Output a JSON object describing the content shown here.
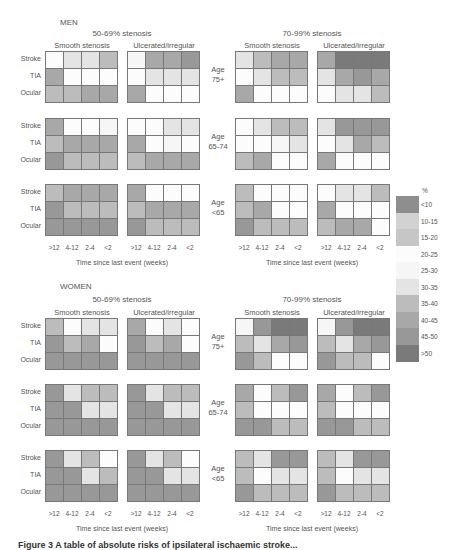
{
  "chart_data": {
    "type": "heatmap",
    "title": "",
    "sexes": [
      "MEN",
      "WOMEN"
    ],
    "stenosis_groups": [
      "50-69% stenosis",
      "70-99% stenosis"
    ],
    "plaque_types": [
      "Smooth stenosis",
      "Ulcerated/irregular"
    ],
    "age_groups": [
      "Age 75+",
      "Age 65-74",
      "Age <65"
    ],
    "rows": [
      "Stroke",
      "TIA",
      "Ocular"
    ],
    "x_ticks": [
      ">12",
      "4-12",
      "2-4",
      "<2"
    ],
    "xlabel": "Time since last event (weeks)",
    "legend": {
      "title": "%",
      "categories": [
        "<10",
        "10-15",
        "15-20",
        "20-25",
        "25-30",
        "30-35",
        "35-40",
        "40-45",
        "45-50",
        ">50"
      ],
      "colors": [
        "#8e8e8e",
        "#d2d2d2",
        "#c6c6c6",
        "#fcfcfc",
        "#f6f6f6",
        "#e4e4e4",
        "#bcbcbc",
        "#a8a8a8",
        "#989898",
        "#7a7a7a"
      ]
    },
    "note": "Cell values are legend category indices (0='<10' ... 9='>50') estimated from grey shade",
    "panels": {
      "MEN": {
        "50-69% stenosis": {
          "Smooth stenosis": {
            "Age 75+": [
              [
                3,
                5,
                5,
                6
              ],
              [
                7,
                3,
                3,
                3
              ],
              [
                6,
                6,
                7,
                7
              ]
            ],
            "Age 65-74": [
              [
                7,
                3,
                3,
                4
              ],
              [
                6,
                7,
                7,
                7
              ],
              [
                8,
                6,
                6,
                6
              ]
            ],
            "Age <65": [
              [
                6,
                7,
                7,
                7
              ],
              [
                8,
                6,
                6,
                6
              ],
              [
                8,
                8,
                8,
                8
              ]
            ]
          },
          "Ulcerated/irregular": {
            "Age 75+": [
              [
                4,
                7,
                7,
                8
              ],
              [
                3,
                5,
                5,
                5
              ],
              [
                7,
                3,
                3,
                3
              ]
            ],
            "Age 65-74": [
              [
                3,
                3,
                5,
                5
              ],
              [
                7,
                3,
                4,
                3
              ],
              [
                6,
                7,
                7,
                7
              ]
            ],
            "Age <65": [
              [
                7,
                3,
                3,
                3
              ],
              [
                6,
                7,
                7,
                7
              ],
              [
                8,
                6,
                6,
                6
              ]
            ]
          }
        },
        "70-99% stenosis": {
          "Smooth stenosis": {
            "Age 75+": [
              [
                5,
                6,
                7,
                7
              ],
              [
                3,
                5,
                6,
                6
              ],
              [
                7,
                3,
                3,
                3
              ]
            ],
            "Age 65-74": [
              [
                3,
                5,
                6,
                6
              ],
              [
                3,
                3,
                4,
                5
              ],
              [
                6,
                7,
                3,
                3
              ]
            ],
            "Age <65": [
              [
                6,
                3,
                3,
                3
              ],
              [
                6,
                7,
                3,
                3
              ],
              [
                8,
                6,
                6,
                6
              ]
            ]
          },
          "Ulcerated/irregular": {
            "Age 75+": [
              [
                7,
                9,
                9,
                9
              ],
              [
                5,
                7,
                8,
                7
              ],
              [
                3,
                5,
                5,
                6
              ]
            ],
            "Age 65-74": [
              [
                5,
                8,
                8,
                8
              ],
              [
                3,
                5,
                7,
                6
              ],
              [
                7,
                3,
                3,
                3
              ]
            ],
            "Age <65": [
              [
                3,
                5,
                5,
                6
              ],
              [
                7,
                3,
                3,
                3
              ],
              [
                6,
                7,
                7,
                3
              ]
            ]
          }
        }
      },
      "WOMEN": {
        "50-69% stenosis": {
          "Smooth stenosis": {
            "Age 75+": [
              [
                6,
                3,
                5,
                5
              ],
              [
                8,
                6,
                7,
                3
              ],
              [
                8,
                8,
                8,
                8
              ]
            ],
            "Age 65-74": [
              [
                8,
                5,
                6,
                6
              ],
              [
                8,
                8,
                5,
                5
              ],
              [
                8,
                8,
                8,
                8
              ]
            ],
            "Age <65": [
              [
                8,
                5,
                6,
                3
              ],
              [
                8,
                8,
                5,
                6
              ],
              [
                8,
                8,
                8,
                8
              ]
            ]
          },
          "Ulcerated/irregular": {
            "Age 75+": [
              [
                7,
                3,
                5,
                3
              ],
              [
                8,
                6,
                7,
                3
              ],
              [
                8,
                8,
                8,
                8
              ]
            ],
            "Age 65-74": [
              [
                8,
                5,
                6,
                6
              ],
              [
                8,
                8,
                5,
                5
              ],
              [
                8,
                8,
                8,
                8
              ]
            ],
            "Age <65": [
              [
                8,
                5,
                6,
                3
              ],
              [
                8,
                8,
                5,
                5
              ],
              [
                8,
                8,
                8,
                8
              ]
            ]
          }
        },
        "70-99% stenosis": {
          "Smooth stenosis": {
            "Age 75+": [
              [
                4,
                8,
                9,
                9
              ],
              [
                6,
                5,
                7,
                8
              ],
              [
                8,
                6,
                3,
                3
              ]
            ],
            "Age 65-74": [
              [
                7,
                3,
                6,
                8
              ],
              [
                6,
                3,
                3,
                3
              ],
              [
                8,
                8,
                6,
                6
              ]
            ],
            "Age <65": [
              [
                6,
                5,
                8,
                8
              ],
              [
                6,
                3,
                5,
                5
              ],
              [
                8,
                6,
                6,
                6
              ]
            ]
          },
          "Ulcerated/irregular": {
            "Age 75+": [
              [
                4,
                8,
                9,
                9
              ],
              [
                6,
                5,
                7,
                8
              ],
              [
                8,
                6,
                6,
                3
              ]
            ],
            "Age 65-74": [
              [
                7,
                3,
                6,
                8
              ],
              [
                6,
                3,
                3,
                3
              ],
              [
                8,
                8,
                6,
                6
              ]
            ],
            "Age <65": [
              [
                6,
                5,
                8,
                8
              ],
              [
                6,
                3,
                5,
                5
              ],
              [
                8,
                6,
                6,
                6
              ]
            ]
          }
        }
      }
    }
  },
  "labels": {
    "men": "MEN",
    "women": "WOMEN",
    "sten_50_69": "50-69% stenosis",
    "sten_70_99": "70-99% stenosis",
    "smooth": "Smooth stenosis",
    "ulcerated": "Ulcerated/irregular",
    "rows": [
      "Stroke",
      "TIA",
      "Ocular"
    ],
    "ages": [
      [
        "Age",
        "75+"
      ],
      [
        "Age",
        "65-74"
      ],
      [
        "Age",
        "<65"
      ]
    ],
    "ticks": [
      ">12",
      "4-12",
      "2-4",
      "<2"
    ],
    "xlabel": "Time since last event (weeks)",
    "legend_title": "%",
    "caption": "Figure 3   A table of absolute risks of ipsilateral ischaemic stroke..."
  }
}
